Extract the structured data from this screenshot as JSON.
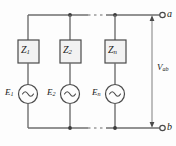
{
  "figure": {
    "type": "circuit-schematic",
    "background_color": "#fdfdfd",
    "wire_color": "#6e6e6e",
    "component_stroke_color": "#4a4a4a",
    "box_fill_color": "#f2f2f2",
    "text_color": "#1a1a1a"
  },
  "terminals": [
    {
      "id": "terminal-a",
      "label": "a",
      "position": "top-right"
    },
    {
      "id": "terminal-b",
      "label": "b",
      "position": "bottom-right"
    }
  ],
  "voltage": {
    "label": "V",
    "subscript": "ab",
    "arrow_style": "double-headed-vertical"
  },
  "branches": [
    {
      "index": 1,
      "impedance": {
        "label": "Z",
        "subscript": "1"
      },
      "source": {
        "label": "E",
        "subscript": "1",
        "type": "ac-source"
      }
    },
    {
      "index": 2,
      "impedance": {
        "label": "Z",
        "subscript": "2"
      },
      "source": {
        "label": "E",
        "subscript": "2",
        "type": "ac-source"
      }
    },
    {
      "index": 3,
      "impedance": {
        "label": "Z",
        "subscript": "n"
      },
      "source": {
        "label": "E",
        "subscript": "n",
        "type": "ac-source"
      }
    }
  ],
  "ellipsis": {
    "present": true,
    "style": "dashed-gap",
    "locations": [
      "top-rail",
      "bottom-rail"
    ]
  }
}
